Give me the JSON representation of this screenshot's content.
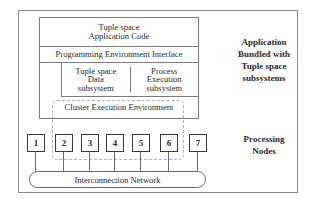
{
  "diagram": {
    "stack": {
      "application_code": [
        "Tuple space",
        "Application Code"
      ],
      "programming_interface": "Programming Environment Interface",
      "subsystems": [
        {
          "lines": [
            "Tuple space",
            "Data",
            "subsystem"
          ]
        },
        {
          "lines": [
            "Process",
            "Execution",
            "subsystem"
          ]
        }
      ],
      "cluster_env": "Cluster Execution Environment"
    },
    "nodes": [
      "1",
      "2",
      "3",
      "4",
      "5",
      "6",
      "7"
    ],
    "network": "Interconnection Network",
    "side_labels": {
      "application": [
        "Application",
        "Bundled with",
        "Tuple space",
        "subsystems"
      ],
      "processing": [
        "Processing",
        "Nodes"
      ]
    }
  }
}
